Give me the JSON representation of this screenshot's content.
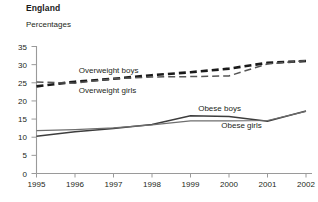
{
  "header": {
    "title": "England",
    "subtitle": "Percentages"
  },
  "chart_data": {
    "type": "line",
    "title": "England",
    "subtitle": "Percentages",
    "xlabel": "",
    "ylabel": "Percentages",
    "ylim": [
      0,
      35
    ],
    "yticks": [
      0,
      5,
      10,
      15,
      20,
      25,
      30,
      35
    ],
    "grid": false,
    "legend_position": "inline-labels",
    "categories": [
      1995,
      1996,
      1997,
      1998,
      1999,
      2000,
      2001,
      2002
    ],
    "xtick_labels": [
      "1995",
      "1996",
      "1997",
      "1998",
      "1999",
      "2000",
      "2001",
      "2002"
    ],
    "series": [
      {
        "name": "Overweight boys",
        "style": "dashed-thick",
        "color": "#1a1a1a",
        "label_x": 1996.1,
        "label_y": 27.6,
        "values": [
          24.0,
          25.3,
          26.1,
          27.1,
          27.9,
          28.9,
          30.5,
          31.0
        ]
      },
      {
        "name": "Overweight girls",
        "style": "dashed-thin",
        "color": "#555555",
        "label_x": 1996.1,
        "label_y": 22.3,
        "values": [
          25.2,
          24.9,
          26.1,
          26.6,
          26.7,
          26.9,
          30.2,
          31.1
        ]
      },
      {
        "name": "Obese boys",
        "style": "solid-thick",
        "color": "#3d3d3d",
        "label_x": 1999.2,
        "label_y": 17.3,
        "values": [
          10.3,
          11.5,
          12.4,
          13.5,
          15.9,
          15.7,
          14.4,
          17.2
        ]
      },
      {
        "name": "Obese girls",
        "style": "solid-thin",
        "color": "#6e6e6e",
        "label_x": 1999.8,
        "label_y": 12.6,
        "values": [
          11.8,
          12.1,
          12.6,
          13.4,
          14.5,
          14.5,
          14.6,
          17.1
        ]
      }
    ]
  }
}
